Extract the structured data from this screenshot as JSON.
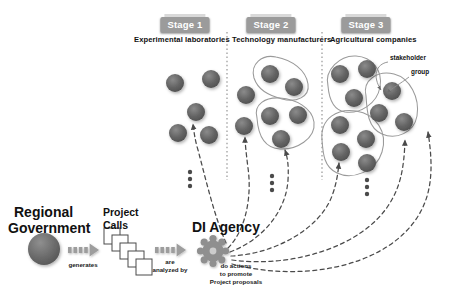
{
  "figure": {
    "background": "#ffffff",
    "node_color": "#5f5f5f",
    "badge_color": "#9b9b9b",
    "arrow_color": "#8a8a8a"
  },
  "stages": [
    {
      "badge": "Stage 1",
      "title": "Experimental laboratories",
      "badge_x": 185,
      "badge_y": 17,
      "title_x": 134,
      "title_y": 37,
      "ellipsis_x": 190,
      "ellipsis_y": 172,
      "nodes": [
        {
          "cx": 175,
          "cy": 83,
          "r": 9
        },
        {
          "cx": 211,
          "cy": 79,
          "r": 9
        },
        {
          "cx": 196,
          "cy": 112,
          "r": 9
        },
        {
          "cx": 178,
          "cy": 133,
          "r": 9
        },
        {
          "cx": 209,
          "cy": 135,
          "r": 9
        }
      ],
      "groups": []
    },
    {
      "badge": "Stage 2",
      "title": "Technology manufacturers",
      "badge_x": 271,
      "badge_y": 17,
      "title_x": 232,
      "title_y": 37,
      "ellipsis_x": 272,
      "ellipsis_y": 178,
      "nodes": [
        {
          "cx": 246,
          "cy": 95,
          "r": 9
        },
        {
          "cx": 244,
          "cy": 126,
          "r": 9
        },
        {
          "cx": 268,
          "cy": 72,
          "r": 9
        },
        {
          "cx": 293,
          "cy": 86,
          "r": 9
        },
        {
          "cx": 268,
          "cy": 114,
          "r": 9
        },
        {
          "cx": 297,
          "cy": 114,
          "r": 9
        },
        {
          "cx": 279,
          "cy": 139,
          "r": 9
        }
      ],
      "groups": [
        {
          "points": "256,57 292,68 306,86 297,99 268,92 254,78"
        },
        {
          "points": "262,101 300,98 313,118 292,147 269,145 256,124"
        }
      ]
    },
    {
      "badge": "Stage 3",
      "title": "Agricultural companies",
      "badge_x": 366,
      "badge_y": 17,
      "title_x": 330,
      "title_y": 37,
      "ellipsis_x": 367,
      "ellipsis_y": 178,
      "nodes": [
        {
          "cx": 340,
          "cy": 73,
          "r": 9
        },
        {
          "cx": 367,
          "cy": 68,
          "r": 9
        },
        {
          "cx": 354,
          "cy": 98,
          "r": 9
        },
        {
          "cx": 392,
          "cy": 90,
          "r": 9
        },
        {
          "cx": 378,
          "cy": 112,
          "r": 9
        },
        {
          "cx": 404,
          "cy": 121,
          "r": 9
        },
        {
          "cx": 340,
          "cy": 124,
          "r": 9
        },
        {
          "cx": 365,
          "cy": 138,
          "r": 9
        },
        {
          "cx": 340,
          "cy": 151,
          "r": 9
        },
        {
          "cx": 366,
          "cy": 162,
          "r": 9
        }
      ],
      "groups": [
        {
          "points": "332,60 362,55 381,74 372,101 345,112 327,92"
        },
        {
          "points": "374,76 400,74 417,102 411,128 390,135 369,122 364,96"
        },
        {
          "points": "328,112 358,110 386,131 379,158 350,177 330,167 322,139"
        }
      ]
    }
  ],
  "dividers": [
    {
      "x": 227,
      "y1": 32,
      "y2": 180
    },
    {
      "x": 322,
      "y1": 32,
      "y2": 180
    }
  ],
  "annotation": {
    "line1": "stakeholder",
    "line2": "group",
    "line1_x": 392,
    "line1_y": 58,
    "line2_x": 412,
    "line2_y": 72
  },
  "flow": {
    "government": {
      "line1": "Regional",
      "line2": "Government",
      "x": 14,
      "y": 208
    },
    "government_node": {
      "cx": 44,
      "cy": 249,
      "r": 16
    },
    "generates_caption": "generates",
    "generates_x": 81,
    "generates_y": 262,
    "project_calls": {
      "line1": "Project",
      "line2": "Calls",
      "x": 101,
      "y": 209
    },
    "analyzed_caption_line1": "are",
    "analyzed_caption_line2": "analyzed by",
    "analyzed_x": 168,
    "analyzed_y": 258,
    "agency_label": "DI Agency",
    "agency_x": 196,
    "agency_y": 223,
    "agency_gear": {
      "cx": 213,
      "cy": 251,
      "r": 12
    },
    "actions_caption_line1": "do actions",
    "actions_caption_line2": "to promote",
    "actions_caption_line3": "Project proposals",
    "actions_x": 233,
    "actions_y": 263
  }
}
